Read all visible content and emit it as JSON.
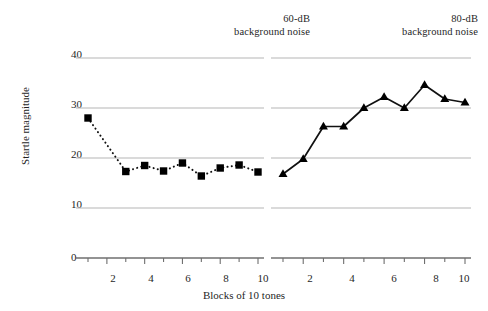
{
  "figure": {
    "xlabel": "Blocks of 10 tones",
    "ylabel": "Startle magnitude",
    "panel_titles": {
      "left_line1": "60-dB",
      "left_line2": "background noise",
      "right_line1": "80-dB",
      "right_line2": "background noise"
    },
    "y_ticks": [
      "40",
      "30",
      "20",
      "10",
      "0"
    ],
    "x_ticks": [
      "2",
      "4",
      "6",
      "8",
      "10"
    ],
    "colors": {
      "line": "#111111",
      "marker": "#000000",
      "gridline": "#b5b5b5",
      "axis": "#6f6f6f",
      "text": "#1f1f1f",
      "background": "#ffffff"
    }
  },
  "chart_data": {
    "type": "line",
    "title": "",
    "xlabel": "Blocks of 10 tones",
    "ylabel": "Startle magnitude",
    "ylim": [
      0,
      40
    ],
    "xlim": [
      1,
      10
    ],
    "yticks": [
      0,
      10,
      20,
      30,
      40
    ],
    "xticks": [
      2,
      4,
      6,
      8,
      10
    ],
    "grid": "horizontal",
    "legend": "none",
    "panels": [
      {
        "name": "60-dB background noise",
        "marker": "square",
        "linestyle": "dotted",
        "x": [
          1,
          2,
          3,
          4,
          5,
          6,
          7,
          8,
          9,
          10
        ],
        "values": [
          28.0,
          null,
          17.3,
          18.5,
          17.4,
          19.0,
          16.4,
          18.0,
          18.6,
          17.2
        ]
      },
      {
        "name": "80-dB background noise",
        "marker": "triangle",
        "linestyle": "solid",
        "x": [
          1,
          2,
          3,
          4,
          5,
          6,
          7,
          8,
          9,
          10
        ],
        "values": [
          16.8,
          19.8,
          26.3,
          26.3,
          30.0,
          32.2,
          30.0,
          34.6,
          31.8,
          31.1
        ]
      }
    ]
  }
}
